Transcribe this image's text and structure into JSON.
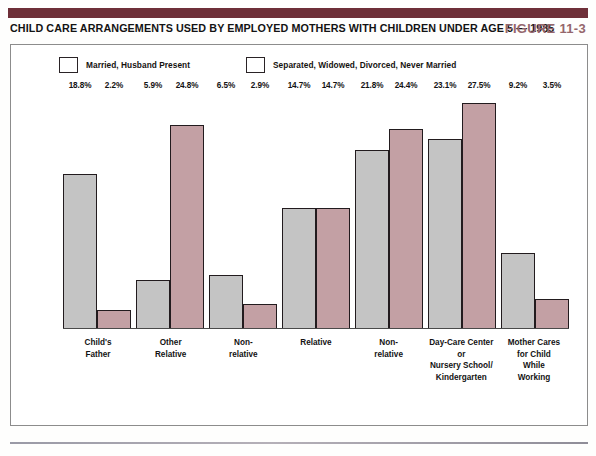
{
  "figure": {
    "title": "CHILD CARE ARRANGEMENTS USED BY EMPLOYED MOTHERS WITH CHILDREN UNDER AGE 5 — 1985",
    "number_label": "FIGURE 11-3",
    "banner_color": "#6e2f38",
    "figure_number_color": "#95666c"
  },
  "legend": {
    "items": [
      {
        "label": "Married, Husband Present",
        "color": "#c4c4c4",
        "swatch_name": "married-swatch"
      },
      {
        "label": "Separated, Widowed, Divorced, Never Married",
        "color": "#c3a0a4",
        "swatch_name": "separated-swatch"
      }
    ]
  },
  "chart_data": {
    "type": "bar",
    "title": "CHILD CARE ARRANGEMENTS USED BY EMPLOYED MOTHERS WITH CHILDREN UNDER AGE 5 — 1985",
    "xlabel": "",
    "ylabel": "",
    "ylim": [
      0,
      29
    ],
    "grid": false,
    "legend_position": "top-left",
    "categories": [
      "Child's Father",
      "Other Relative",
      "Non-relative",
      "Relative",
      "Non-relative",
      "Day-Care Center or Nursery School/Kindergarten",
      "Mother Cares for Child While Working"
    ],
    "category_lines": [
      [
        "Child's",
        "Father"
      ],
      [
        "Other",
        "Relative"
      ],
      [
        "Non-",
        "relative"
      ],
      [
        "Relative"
      ],
      [
        "Non-",
        "relative"
      ],
      [
        "Day-Care Center",
        "or",
        "Nursery School/",
        "Kindergarten"
      ],
      [
        "Mother Cares",
        "for Child",
        "While",
        "Working"
      ]
    ],
    "series": [
      {
        "name": "Married, Husband Present",
        "color": "#c4c4c4",
        "values": [
          18.8,
          5.9,
          6.5,
          14.7,
          21.8,
          23.1,
          9.2
        ],
        "value_labels": [
          "18.8%",
          "5.9%",
          "6.5%",
          "14.7%",
          "21.8%",
          "23.1%",
          "9.2%"
        ]
      },
      {
        "name": "Separated, Widowed, Divorced, Never Married",
        "color": "#c3a0a4",
        "values": [
          2.2,
          24.8,
          2.9,
          14.7,
          24.4,
          27.5,
          3.5
        ],
        "value_labels": [
          "2.2%",
          "24.8%",
          "2.9%",
          "14.7%",
          "24.4%",
          "27.5%",
          "3.5%"
        ]
      }
    ]
  }
}
